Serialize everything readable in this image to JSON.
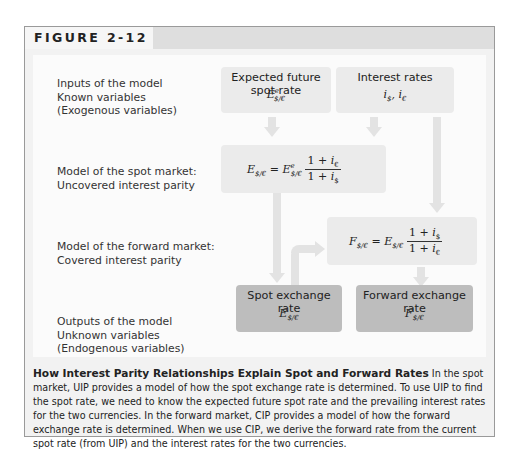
{
  "figure": {
    "label": "FIGURE 2-12"
  },
  "rows": [
    {
      "id": "inputs",
      "label": "Inputs of the model\nKnown variables\n(Exogenous variables)"
    },
    {
      "id": "spot-model",
      "label": "Model of the spot market:\nUncovered interest parity"
    },
    {
      "id": "forward-model",
      "label": "Model of the forward market:\nCovered interest parity"
    },
    {
      "id": "outputs",
      "label": "Outputs of the model\nUnknown variables\n(Endogenous variables)"
    }
  ],
  "boxes": {
    "expected_spot": {
      "title": "Expected future spot rate",
      "var": "E",
      "sup": "e",
      "sub": "$/€"
    },
    "interest_rates": {
      "title": "Interest rates",
      "var": "i$, i€"
    },
    "uip": {
      "formula": "E$/€ = Ee$/€ (1 + i€)/(1 + i$)",
      "lhs": "E",
      "lhs_sub": "$/€",
      "rhs": "E",
      "rhs_sup": "e",
      "rhs_sub": "$/€",
      "num": "1 + ",
      "num_var": "i",
      "num_sub": "€",
      "den": "1 + ",
      "den_var": "i",
      "den_sub": "$"
    },
    "cip": {
      "formula": "F$/€ = E$/€ (1 + i$)/(1 + i€)",
      "lhs": "F",
      "lhs_sub": "$/€",
      "rhs": "E",
      "rhs_sub": "$/€",
      "num": "1 + ",
      "num_var": "i",
      "num_sub": "$",
      "den": "1 + ",
      "den_var": "i",
      "den_sub": "€"
    },
    "spot_rate": {
      "title": "Spot exchange rate",
      "var": "E",
      "sub": "$/€"
    },
    "forward_rate": {
      "title": "Forward exchange rate",
      "var": "F",
      "sub": "$/€"
    }
  },
  "colors": {
    "light_box": "#ebebeb",
    "dark_box": "#bdbdbd",
    "arrow": "#e3e3e3",
    "header_band": "#dedede"
  },
  "caption": {
    "title": "How Interest Parity Relationships Explain Spot and Forward Rates",
    "text": " In the spot market, UIP provides a model of how the spot exchange rate is determined. To use UIP to find the spot rate, we need to know the expected future spot rate and the prevailing interest rates for the two currencies. In the forward market, CIP provides a model of how the forward exchange rate is determined. When we use CIP, we derive the forward rate from the current spot rate (from UIP) and the interest rates for the two currencies."
  }
}
